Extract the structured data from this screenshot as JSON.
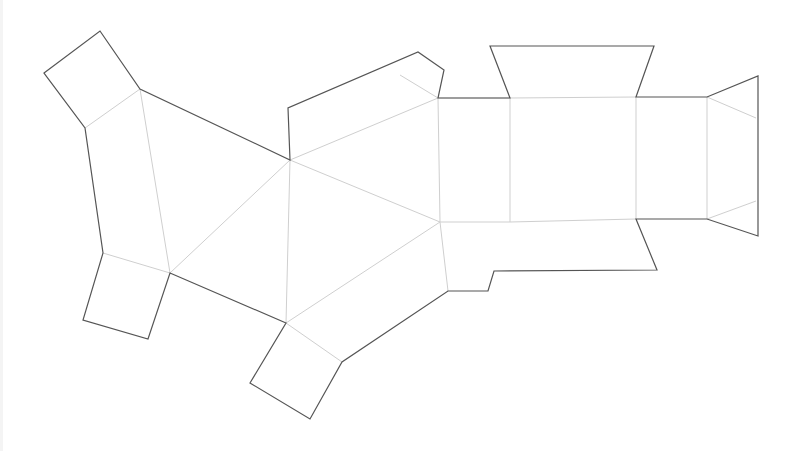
{
  "diagram": {
    "colors": {
      "cut_line": "#555555",
      "fold_line": "#cfcfcf",
      "background": "#ffffff"
    },
    "cut_outline": [
      [
        44,
        73
      ],
      [
        100,
        31
      ],
      [
        140,
        89
      ],
      [
        290,
        160
      ],
      [
        288,
        108
      ],
      [
        418,
        52
      ],
      [
        444,
        70
      ],
      [
        438,
        98
      ],
      [
        510,
        98
      ],
      [
        490,
        46
      ],
      [
        654,
        46
      ],
      [
        636,
        97
      ],
      [
        707,
        97
      ],
      [
        758,
        76
      ],
      [
        758,
        236
      ],
      [
        707,
        219
      ],
      [
        636,
        219
      ],
      [
        657,
        270
      ],
      [
        494,
        271
      ],
      [
        488,
        291
      ],
      [
        448,
        291
      ],
      [
        342,
        362
      ],
      [
        310,
        419
      ],
      [
        250,
        383
      ],
      [
        286,
        323
      ],
      [
        170,
        273
      ],
      [
        148,
        339
      ],
      [
        83,
        320
      ],
      [
        103,
        253
      ],
      [
        85,
        128
      ]
    ],
    "fold_lines": [
      [
        [
          85,
          128
        ],
        [
          140,
          89
        ]
      ],
      [
        [
          140,
          89
        ],
        [
          170,
          273
        ]
      ],
      [
        [
          103,
          253
        ],
        [
          170,
          273
        ]
      ],
      [
        [
          170,
          273
        ],
        [
          290,
          160
        ]
      ],
      [
        [
          290,
          160
        ],
        [
          286,
          323
        ]
      ],
      [
        [
          290,
          160
        ],
        [
          438,
          98
        ]
      ],
      [
        [
          290,
          160
        ],
        [
          440,
          222
        ]
      ],
      [
        [
          286,
          323
        ],
        [
          440,
          222
        ]
      ],
      [
        [
          286,
          323
        ],
        [
          342,
          362
        ]
      ],
      [
        [
          440,
          222
        ],
        [
          448,
          291
        ]
      ],
      [
        [
          438,
          98
        ],
        [
          440,
          222
        ]
      ],
      [
        [
          400,
          75
        ],
        [
          438,
          98
        ]
      ],
      [
        [
          438,
          98
        ],
        [
          510,
          98
        ]
      ],
      [
        [
          510,
          98
        ],
        [
          636,
          97
        ]
      ],
      [
        [
          440,
          222
        ],
        [
          510,
          222
        ]
      ],
      [
        [
          510,
          222
        ],
        [
          636,
          219
        ]
      ],
      [
        [
          510,
          98
        ],
        [
          510,
          222
        ]
      ],
      [
        [
          636,
          97
        ],
        [
          636,
          219
        ]
      ],
      [
        [
          707,
          97
        ],
        [
          707,
          219
        ]
      ],
      [
        [
          707,
          97
        ],
        [
          756,
          118
        ]
      ],
      [
        [
          707,
          219
        ],
        [
          756,
          201
        ]
      ]
    ]
  }
}
